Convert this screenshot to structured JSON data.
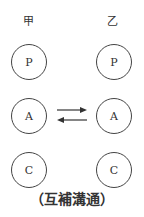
{
  "diagram": {
    "left_label": "甲",
    "right_label": "乙",
    "left_nodes": [
      "P",
      "A",
      "C"
    ],
    "right_nodes": [
      "P",
      "A",
      "C"
    ],
    "caption": "（互補溝通）",
    "arrows": [
      {
        "from": "甲.A",
        "to": "乙.A",
        "direction": "right"
      },
      {
        "from": "乙.A",
        "to": "甲.A",
        "direction": "left"
      }
    ]
  }
}
